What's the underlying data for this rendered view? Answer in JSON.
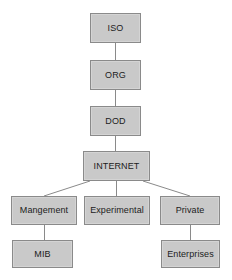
{
  "diagram": {
    "type": "tree",
    "background_color": "#ffffff",
    "node_fill_color": "#c9c9c9",
    "node_border_color": "#8a8a8a",
    "edge_color": "#8a8a8a",
    "text_color": "#1c1c1c",
    "nodes": [
      {
        "id": "iso",
        "label": "ISO",
        "level": 0
      },
      {
        "id": "org",
        "label": "ORG",
        "level": 1
      },
      {
        "id": "dod",
        "label": "DOD",
        "level": 2
      },
      {
        "id": "internet",
        "label": "INTERNET",
        "level": 3
      },
      {
        "id": "mangement",
        "label": "Mangement",
        "level": 4
      },
      {
        "id": "experimental",
        "label": "Experimental",
        "level": 4
      },
      {
        "id": "private",
        "label": "Private",
        "level": 4
      },
      {
        "id": "mib",
        "label": "MIB",
        "level": 5
      },
      {
        "id": "enterprises",
        "label": "Enterprises",
        "level": 5
      }
    ],
    "edges": [
      {
        "from": "iso",
        "to": "org"
      },
      {
        "from": "org",
        "to": "dod"
      },
      {
        "from": "dod",
        "to": "internet"
      },
      {
        "from": "internet",
        "to": "mangement"
      },
      {
        "from": "internet",
        "to": "experimental"
      },
      {
        "from": "internet",
        "to": "private"
      },
      {
        "from": "mangement",
        "to": "mib"
      },
      {
        "from": "private",
        "to": "enterprises"
      }
    ]
  }
}
